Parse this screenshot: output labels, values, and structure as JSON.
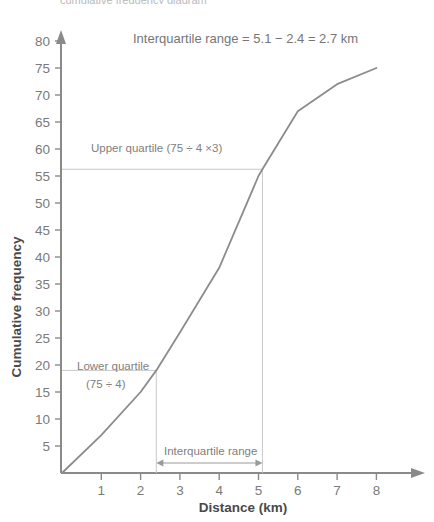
{
  "chart_data": {
    "type": "line",
    "title": "Interquartile range = 5.1 − 2.4 = 2.7 km",
    "xlabel": "Distance (km)",
    "ylabel": "Cumulative frequency",
    "xlim": [
      0,
      8.6
    ],
    "ylim": [
      0,
      82
    ],
    "grid": false,
    "legend": null,
    "x": [
      0,
      1,
      2,
      2.4,
      3,
      4,
      5,
      5.1,
      6,
      7,
      8
    ],
    "values": [
      0,
      7,
      15,
      19,
      26,
      38,
      55,
      56.25,
      67,
      72,
      75
    ],
    "x_ticks": [
      1,
      2,
      3,
      4,
      5,
      6,
      7,
      8
    ],
    "x_tick_labels": [
      "1",
      "2",
      "3",
      "4",
      "5",
      "6",
      "7",
      "8"
    ],
    "y_ticks": [
      5,
      10,
      15,
      20,
      25,
      30,
      35,
      40,
      45,
      50,
      55,
      60,
      65,
      70,
      75,
      80
    ],
    "y_tick_labels": [
      "5",
      "10",
      "15",
      "20",
      "25",
      "30",
      "35",
      "40",
      "45",
      "50",
      "55",
      "60",
      "65",
      "70",
      "75",
      "80"
    ],
    "series_color": "#8c8c8c",
    "axis_color": "#8a8a8a",
    "guide_color": "#c9c9c9",
    "annotations": [
      {
        "name": "lower-quartile",
        "line1": "Lower quartile",
        "line2": "(75 ÷ 4)",
        "x": 2.4,
        "y": 19
      },
      {
        "name": "upper-quartile",
        "line1": "Upper quartile (75 ÷ 4 × 3)",
        "line2": "",
        "x": 5.1,
        "y": 56.25
      },
      {
        "name": "iqr-bracket",
        "line1": "Interquartile range",
        "line2": "",
        "x_from": 2.4,
        "x_to": 5.1
      }
    ]
  },
  "header": {
    "cut_text": "cumulative frequency diagram"
  },
  "axis": {
    "x_title": "Distance (km)",
    "y_title": "Cumulative frequency"
  },
  "equation": {
    "text": "Interquartile range = 5.1 − 2.4 = 2.7 km"
  },
  "labels": {
    "lower_quartile_line1": "Lower quartile",
    "lower_quartile_line2": "(75 ÷ 4)",
    "upper_quartile": "Upper quartile (75 ÷ 4 ×3)",
    "iqr_bracket": "Interquartile range"
  }
}
